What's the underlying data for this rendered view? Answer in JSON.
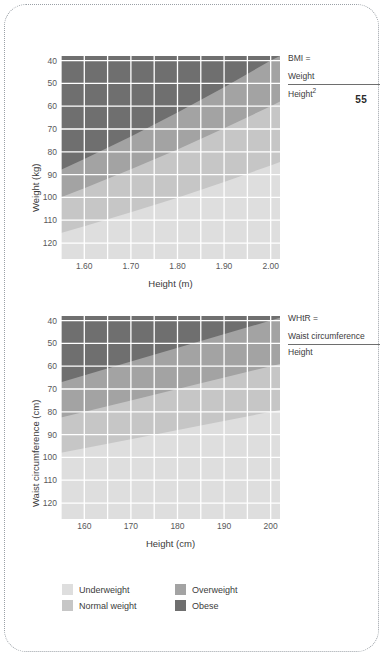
{
  "page": {
    "number": "55",
    "background": "#ffffff",
    "frame_color": "#9aa0a6"
  },
  "palette": {
    "underweight": "#dedede",
    "normal": "#c6c6c6",
    "overweight": "#a3a3a3",
    "obese": "#6f6f6f",
    "gridline": "#ffffff",
    "text": "#3c3c3c"
  },
  "legend": {
    "position": "bottom-left",
    "items": [
      {
        "label": "Underweight",
        "color": "#dedede"
      },
      {
        "label": "Normal weight",
        "color": "#c6c6c6"
      },
      {
        "label": "Overweight",
        "color": "#a3a3a3"
      },
      {
        "label": "Obese",
        "color": "#6f6f6f"
      }
    ]
  },
  "charts": [
    {
      "id": "bmi",
      "formula": {
        "head": "BMI  =",
        "numerator": "Weight",
        "denominator": "Height",
        "denominator_sup": "2"
      },
      "xlabel": "Height (m)",
      "ylabel": "Weight (kg)",
      "xticks": [
        "1.60",
        "1.70",
        "1.80",
        "1.90",
        "2.00"
      ],
      "yticks": [
        "120",
        "110",
        "100",
        "90",
        "80",
        "70",
        "60",
        "50",
        "40"
      ]
    },
    {
      "id": "whtr",
      "formula": {
        "head": "WHtR  =",
        "numerator": "Waist circumference",
        "denominator": "Height",
        "denominator_sup": ""
      },
      "xlabel": "Height (cm)",
      "ylabel": "Waist circumference (cm)",
      "xticks": [
        "160",
        "170",
        "180",
        "190",
        "200"
      ],
      "yticks": [
        "120",
        "110",
        "100",
        "90",
        "80",
        "70",
        "60",
        "50",
        "40"
      ]
    }
  ],
  "chart_data": [
    {
      "type": "area",
      "id": "bmi-nomogram",
      "title": "",
      "xlabel": "Height (m)",
      "ylabel": "Weight (kg)",
      "xlim": [
        1.55,
        2.02
      ],
      "ylim": [
        33,
        122
      ],
      "xticks": [
        1.6,
        1.7,
        1.8,
        1.9,
        2.0
      ],
      "yticks": [
        40,
        50,
        60,
        70,
        80,
        90,
        100,
        110,
        120
      ],
      "grid": true,
      "minor_grid_x": true,
      "legend_position": "below-figure",
      "annotation": "BMI = Weight / Height²",
      "bands": [
        {
          "name": "Underweight",
          "color": "#dedede",
          "rule": "BMI < 18.5",
          "upper_boundary_bmi": 18.5,
          "boundary_points": [
            {
              "x": 1.55,
              "y": 44.4
            },
            {
              "x": 1.6,
              "y": 47.4
            },
            {
              "x": 1.7,
              "y": 53.5
            },
            {
              "x": 1.8,
              "y": 59.9
            },
            {
              "x": 1.9,
              "y": 66.8
            },
            {
              "x": 2.0,
              "y": 74.0
            },
            {
              "x": 2.02,
              "y": 75.5
            }
          ]
        },
        {
          "name": "Normal weight",
          "color": "#c6c6c6",
          "rule": "18.5 <= BMI < 25",
          "upper_boundary_bmi": 25,
          "boundary_points": [
            {
              "x": 1.55,
              "y": 60.1
            },
            {
              "x": 1.6,
              "y": 64.0
            },
            {
              "x": 1.7,
              "y": 72.3
            },
            {
              "x": 1.8,
              "y": 81.0
            },
            {
              "x": 1.9,
              "y": 90.3
            },
            {
              "x": 2.0,
              "y": 100.0
            },
            {
              "x": 2.02,
              "y": 102.0
            }
          ]
        },
        {
          "name": "Overweight",
          "color": "#a3a3a3",
          "rule": "25 <= BMI < 30",
          "upper_boundary_bmi": 30,
          "boundary_points": [
            {
              "x": 1.55,
              "y": 72.1
            },
            {
              "x": 1.6,
              "y": 76.8
            },
            {
              "x": 1.7,
              "y": 86.7
            },
            {
              "x": 1.8,
              "y": 97.2
            },
            {
              "x": 1.9,
              "y": 108.3
            },
            {
              "x": 2.0,
              "y": 120.0
            },
            {
              "x": 2.02,
              "y": 122.0
            }
          ]
        },
        {
          "name": "Obese",
          "color": "#6f6f6f",
          "rule": "BMI >= 30",
          "upper_boundary_bmi": null,
          "boundary_points": []
        }
      ]
    },
    {
      "type": "area",
      "id": "whtr-nomogram",
      "title": "",
      "xlabel": "Height (cm)",
      "ylabel": "Waist circumference (cm)",
      "xlim": [
        155,
        202
      ],
      "ylim": [
        33,
        122
      ],
      "xticks": [
        160,
        170,
        180,
        190,
        200
      ],
      "yticks": [
        40,
        50,
        60,
        70,
        80,
        90,
        100,
        110,
        120
      ],
      "grid": true,
      "minor_grid_x": true,
      "legend_position": "below-figure",
      "annotation": "WHtR = Waist circumference / Height",
      "bands": [
        {
          "name": "Underweight",
          "color": "#dedede",
          "rule": "WHtR < 0.40",
          "upper_boundary_ratio": 0.4,
          "boundary_points": [
            {
              "x": 155,
              "y": 62.0
            },
            {
              "x": 170,
              "y": 68.0
            },
            {
              "x": 185,
              "y": 74.0
            },
            {
              "x": 200,
              "y": 80.0
            },
            {
              "x": 202,
              "y": 80.8
            }
          ]
        },
        {
          "name": "Normal weight",
          "color": "#c6c6c6",
          "rule": "0.40 <= WHtR < 0.50",
          "upper_boundary_ratio": 0.5,
          "boundary_points": [
            {
              "x": 155,
              "y": 77.5
            },
            {
              "x": 170,
              "y": 85.0
            },
            {
              "x": 185,
              "y": 92.5
            },
            {
              "x": 200,
              "y": 100.0
            },
            {
              "x": 202,
              "y": 101.0
            }
          ]
        },
        {
          "name": "Overweight",
          "color": "#a3a3a3",
          "rule": "0.50 <= WHtR < 0.60",
          "upper_boundary_ratio": 0.6,
          "boundary_points": [
            {
              "x": 155,
              "y": 93.0
            },
            {
              "x": 170,
              "y": 102.0
            },
            {
              "x": 185,
              "y": 111.0
            },
            {
              "x": 200,
              "y": 120.0
            },
            {
              "x": 202,
              "y": 121.2
            }
          ]
        },
        {
          "name": "Obese",
          "color": "#6f6f6f",
          "rule": "WHtR >= 0.60",
          "upper_boundary_ratio": null,
          "boundary_points": []
        }
      ]
    }
  ]
}
